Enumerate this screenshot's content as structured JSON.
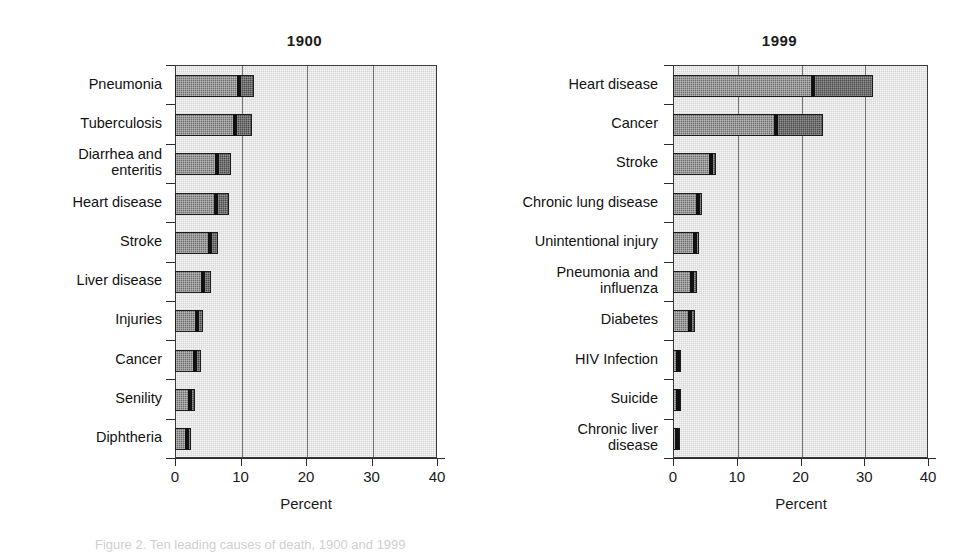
{
  "figure": {
    "caption": "Figure 2. Ten leading causes of death, 1900 and 1999"
  },
  "chart_data": [
    {
      "type": "bar",
      "orientation": "horizontal",
      "title": "1900",
      "xlabel": "Percent",
      "ylabel": "",
      "xlim": [
        0,
        40
      ],
      "xticks": [
        "0",
        "10",
        "20",
        "30",
        "40"
      ],
      "grid": true,
      "legend": "none",
      "categories": [
        "Pneumonia",
        "Tuberculosis",
        "Diarrhea and\nenteritis",
        "Heart disease",
        "Stroke",
        "Liver disease",
        "Injuries",
        "Cancer",
        "Senility",
        "Diphtheria"
      ],
      "values": [
        12.1,
        11.7,
        8.6,
        8.2,
        6.6,
        5.5,
        4.2,
        3.9,
        3.0,
        2.4
      ],
      "inner_marks": [
        9.8,
        9.2,
        6.4,
        6.2,
        5.3,
        4.2,
        3.3,
        3.0,
        2.3,
        1.8
      ]
    },
    {
      "type": "bar",
      "orientation": "horizontal",
      "title": "1999",
      "xlabel": "Percent",
      "ylabel": "",
      "xlim": [
        0,
        40
      ],
      "xticks": [
        "0",
        "10",
        "20",
        "30",
        "40"
      ],
      "grid": true,
      "legend": "none",
      "categories": [
        "Heart disease",
        "Cancer",
        "Stroke",
        "Chronic lung disease",
        "Unintentional  injury",
        "Pneumonia and\ninfluenza",
        "Diabetes",
        "HIV Infection",
        "Suicide",
        "Chronic liver\ndisease"
      ],
      "values": [
        31.4,
        23.5,
        6.8,
        4.6,
        4.1,
        3.7,
        3.5,
        1.3,
        1.3,
        1.1
      ],
      "inner_marks": [
        22.0,
        16.2,
        5.9,
        3.9,
        3.4,
        3.0,
        2.7,
        0.9,
        0.9,
        0.7
      ]
    }
  ],
  "colors": {
    "plot_background": "#d7d7d7",
    "bar_light": "#6e6e6e",
    "bar_dark": "#4a4a4a",
    "divider": "#111111",
    "axis": "#2b2b2b"
  }
}
